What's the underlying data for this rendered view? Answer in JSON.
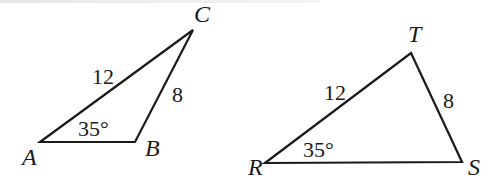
{
  "figure": {
    "stroke_color": "#1a1a1a",
    "triangles": [
      {
        "name": "ABC",
        "vertices": {
          "A": {
            "label": "A",
            "x": 40,
            "y": 142
          },
          "B": {
            "label": "B",
            "x": 135,
            "y": 142
          },
          "C": {
            "label": "C",
            "x": 193,
            "y": 30
          }
        },
        "side_labels": {
          "AC": "12",
          "BC": "8"
        },
        "angle_label": "35°",
        "angle_vertex": "A"
      },
      {
        "name": "RST",
        "vertices": {
          "R": {
            "label": "R",
            "x": 265,
            "y": 163
          },
          "S": {
            "label": "S",
            "x": 462,
            "y": 162
          },
          "T": {
            "label": "T",
            "x": 411,
            "y": 53
          }
        },
        "side_labels": {
          "RT": "12",
          "ST": "8"
        },
        "angle_label": "35°",
        "angle_vertex": "R"
      }
    ]
  }
}
